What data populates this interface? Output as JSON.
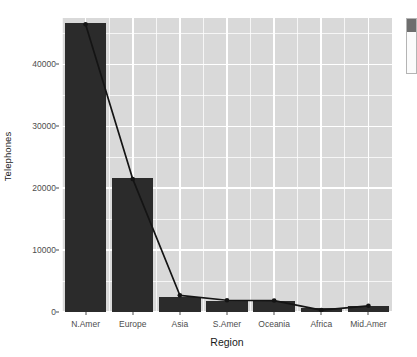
{
  "chart_data": {
    "type": "bar",
    "title": "",
    "subtitle": "",
    "xlabel": "Region",
    "ylabel": "Telephones",
    "categories": [
      "N.Amer",
      "Europe",
      "Asia",
      "S.Amer",
      "Oceania",
      "Africa",
      "Mid.Amer"
    ],
    "values": [
      46700,
      21700,
      2400,
      1800,
      1750,
      600,
      900
    ],
    "series": [
      {
        "name": "Telephones (bars)",
        "type": "bar",
        "values": [
          46700,
          21700,
          2400,
          1800,
          1750,
          600,
          900
        ]
      },
      {
        "name": "Telephones (line overlay)",
        "type": "line",
        "values": [
          46500,
          21500,
          2700,
          1900,
          1850,
          300,
          1000
        ]
      }
    ],
    "ylim": [
      0,
      47500
    ],
    "y_ticks": [
      0,
      10000,
      20000,
      30000,
      40000
    ],
    "y_tick_labels": [
      "0",
      "10000",
      "20000",
      "30000",
      "40000"
    ],
    "x_tick_labels": [
      "N.Amer",
      "Europe",
      "Asia",
      "S.Amer",
      "Oceania",
      "Africa",
      "Mid.Amer"
    ],
    "grid": true,
    "grid_minor": true,
    "legend": "none",
    "legend_position": "none",
    "panel_background": "#d9d9d9",
    "grid_color": "#ffffff",
    "bar_color": "#2b2b2b",
    "line_color": "#141414",
    "point_color": "#141414",
    "annotations": []
  },
  "axes": {
    "y_title": "Telephones",
    "x_title": "Region"
  },
  "side_panel": {
    "present": true,
    "label": ""
  }
}
